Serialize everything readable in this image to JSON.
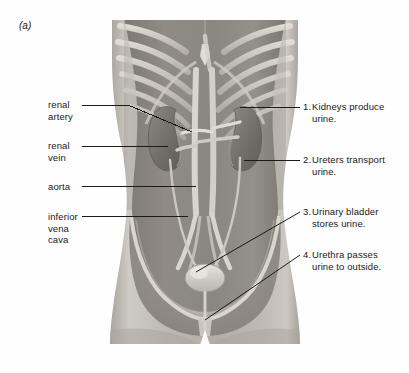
{
  "figure": {
    "panel_letter": "(a)",
    "illustration": "anterior view of human torso showing urinary system: kidneys, ureters, urinary bladder, urethra, aorta and inferior vena cava within rib cage and pelvis",
    "background_color": "#ffffff",
    "line_color": "#1a1a1a",
    "text_color": "#1a1a1a",
    "skin_tone": "#b9b5ad",
    "organ_tone": "#8c8880",
    "vessel_tone": "#d8d5cd"
  },
  "labels_left": [
    {
      "id": "renal-artery",
      "lines": [
        "renal",
        "artery"
      ],
      "x": 48,
      "y": 99
    },
    {
      "id": "renal-vein",
      "lines": [
        "renal",
        "vein"
      ],
      "x": 48,
      "y": 140
    },
    {
      "id": "aorta",
      "lines": [
        "aorta"
      ],
      "x": 48,
      "y": 181
    },
    {
      "id": "inferior-vena-cava",
      "lines": [
        "inferior",
        "vena",
        "cava"
      ],
      "x": 48,
      "y": 211
    }
  ],
  "labels_right": [
    {
      "id": "kidneys",
      "number": "1.",
      "lines": [
        "Kidneys produce",
        "urine."
      ],
      "x": 303,
      "y": 101
    },
    {
      "id": "ureters",
      "number": "2.",
      "lines": [
        "Ureters transport",
        "urine."
      ],
      "x": 303,
      "y": 154
    },
    {
      "id": "urinary-bladder",
      "number": "3.",
      "lines": [
        "Urinary bladder",
        "stores urine."
      ],
      "x": 303,
      "y": 206
    },
    {
      "id": "urethra",
      "number": "4.",
      "lines": [
        "Urethra passes",
        "urine to outside."
      ],
      "x": 303,
      "y": 249
    }
  ],
  "leader_lines": [
    {
      "id": "leader-renal-artery",
      "points": "82,105 128,105 192,132"
    },
    {
      "id": "leader-renal-vein",
      "points": "82,146 168,146"
    },
    {
      "id": "leader-aorta",
      "points": "82,186 196,186"
    },
    {
      "id": "leader-inferior-vena-cava",
      "points": "82,216 188,216"
    },
    {
      "id": "leader-kidneys",
      "points": "300,107 240,107"
    },
    {
      "id": "leader-ureters",
      "points": "300,160 244,160"
    },
    {
      "id": "leader-bladder",
      "points": "300,212 196,272"
    },
    {
      "id": "leader-urethra",
      "points": "300,255 205,320"
    }
  ]
}
